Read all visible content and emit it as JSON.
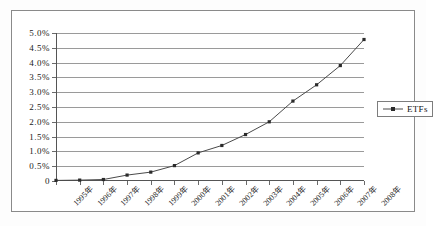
{
  "chart_data": {
    "type": "line",
    "title": "",
    "subtitle": "",
    "xlabel": "",
    "ylabel": "",
    "categories": [
      "1995年",
      "1996年",
      "1997年",
      "1998年",
      "1999年",
      "2000年",
      "2001年",
      "2002年",
      "2003年",
      "2004年",
      "2005年",
      "2006年",
      "2007年",
      "2008年"
    ],
    "series": [
      {
        "name": "ETFs",
        "values": [
          0.02,
          0.03,
          0.05,
          0.2,
          0.3,
          0.52,
          0.95,
          1.2,
          1.57,
          2.0,
          2.7,
          3.25,
          3.9,
          4.78
        ]
      }
    ],
    "ylim": [
      0,
      5.0
    ],
    "ytick_values": [
      0,
      0.5,
      1.0,
      1.5,
      2.0,
      2.5,
      3.0,
      3.5,
      4.0,
      4.5,
      5.0
    ],
    "ytick_labels": [
      "0",
      "0.5%",
      "1.0%",
      "1.5%",
      "2.0%",
      "2.5%",
      "3.0%",
      "3.5%",
      "4.0%",
      "4.5%",
      "5.0%"
    ],
    "grid": "horizontal",
    "legend_position": "right",
    "marker": "square",
    "colors": {
      "line": "#4a4a4a",
      "marker": "#2b2b2b",
      "grid": "#9a9a9a",
      "axis": "#555555",
      "frame": "#8a8a8a",
      "background": "#ffffff",
      "text": "#1a1a1a"
    }
  },
  "legend": {
    "entries": [
      {
        "label": "ETFs"
      }
    ]
  }
}
